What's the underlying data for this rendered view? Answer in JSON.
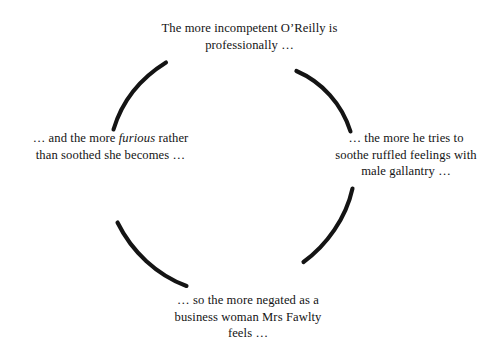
{
  "diagram": {
    "type": "vicious-circle",
    "background_color": "#ffffff",
    "stroke_color": "#141414",
    "text_color": "#141414",
    "center": {
      "x": 247,
      "y": 177
    },
    "radius": 117,
    "nodes": [
      {
        "id": "top",
        "name": "node-top",
        "position": "top",
        "lines": [
          "The more incompetent O’Reilly is",
          "professionally …"
        ]
      },
      {
        "id": "right",
        "name": "node-right",
        "position": "right",
        "lines": [
          "… the more he tries to",
          "soothe ruffled feelings with",
          "male gallantry …"
        ]
      },
      {
        "id": "bottom",
        "name": "node-bottom",
        "position": "bottom",
        "lines": [
          "… so the more negated as a",
          "business woman Mrs Fawlty",
          "feels …"
        ]
      },
      {
        "id": "left",
        "name": "node-left",
        "position": "left",
        "lines_html": [
          "… and the more <em>furious</em> rather",
          "than soothed she becomes …"
        ],
        "emphasis_word": "furious"
      }
    ],
    "arcs": [
      {
        "id": "arc-top-right",
        "name": "arc-top-to-right",
        "from": "top",
        "to": "right"
      },
      {
        "id": "arc-right-bottom",
        "name": "arc-right-to-bottom",
        "from": "right",
        "to": "bottom"
      },
      {
        "id": "arc-bottom-left",
        "name": "arc-bottom-to-left",
        "from": "bottom",
        "to": "left"
      },
      {
        "id": "arc-left-top",
        "name": "arc-left-to-top",
        "from": "left",
        "to": "top"
      }
    ]
  }
}
